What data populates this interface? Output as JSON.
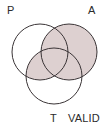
{
  "figure": {
    "name": "three-circle-venn-diagram",
    "width": 109,
    "height": 129,
    "background_color": "#ffffff"
  },
  "labels": {
    "p": "P",
    "a": "A",
    "t": "T",
    "valid": "VALID"
  },
  "style": {
    "shade_color": "#ddd0d0",
    "stroke_color": "#3a3436",
    "stroke_width": 1,
    "text_color": "#2b2b2b",
    "font_size_px": 11
  },
  "chart_data": {
    "type": "venn",
    "title": "",
    "sets": [
      {
        "id": "P",
        "label": "P",
        "cx": 40,
        "cy": 52,
        "r": 28,
        "label_x": 10,
        "label_y": 12
      },
      {
        "id": "A",
        "label": "A",
        "cx": 69,
        "cy": 52,
        "r": 28,
        "label_x": 92,
        "label_y": 12
      },
      {
        "id": "T",
        "label": "T",
        "cx": 54,
        "cy": 76,
        "r": 28,
        "label_x": 53,
        "label_y": 121
      }
    ],
    "annotations": [
      {
        "text": "VALID",
        "x": 82,
        "y": 121
      }
    ],
    "regions": [
      {
        "id": "P-only",
        "sets": [
          "P"
        ],
        "shaded": false
      },
      {
        "id": "A-only",
        "sets": [
          "A"
        ],
        "shaded": true
      },
      {
        "id": "T-only",
        "sets": [
          "T"
        ],
        "shaded": false
      },
      {
        "id": "P-and-A",
        "sets": [
          "P",
          "A"
        ],
        "shaded": true
      },
      {
        "id": "P-and-T",
        "sets": [
          "P",
          "T"
        ],
        "shaded": true
      },
      {
        "id": "A-and-T",
        "sets": [
          "A",
          "T"
        ],
        "shaded": true
      },
      {
        "id": "P-A-T",
        "sets": [
          "P",
          "A",
          "T"
        ],
        "shaded": true
      }
    ],
    "shaded_description": "All of circle A plus the intersection of P and T",
    "legend": null,
    "grid": false
  }
}
